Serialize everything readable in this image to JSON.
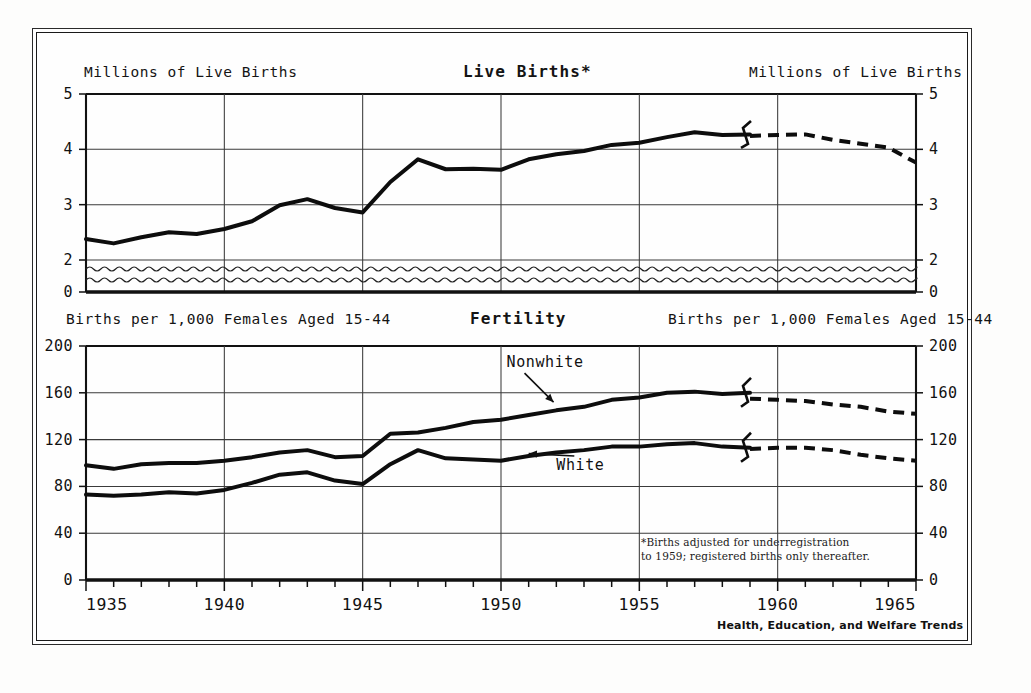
{
  "plate": {
    "source_credit": "Health, Education, and Welfare Trends"
  },
  "upper": {
    "title": "Live Births*",
    "left_axis_label": "Millions of Live Births",
    "right_axis_label": "Millions of Live Births"
  },
  "lower": {
    "title": "Fertility",
    "left_axis_label": "Births per 1,000 Females Aged 15-44",
    "right_axis_label": "Births per 1,000 Females Aged 15-44",
    "footnote": "*Births adjusted for underregistration\nto 1959; registered births only thereafter."
  },
  "chart_data": [
    {
      "type": "line",
      "title": "Live Births*",
      "xlabel": "",
      "ylabel": "Millions of Live Births",
      "xlim": [
        1935,
        1965
      ],
      "ylim": [
        0,
        5
      ],
      "yticks": [
        0,
        2,
        3,
        4,
        5
      ],
      "ytick_labels": [
        "0",
        "2",
        "3",
        "4",
        "5"
      ],
      "axis_break": {
        "between": [
          0,
          2
        ],
        "style": "wavy"
      },
      "xticks": [
        1935,
        1940,
        1945,
        1950,
        1955,
        1960,
        1965
      ],
      "xtick_labels": [
        "1935",
        "1940",
        "1945",
        "1950",
        "1955",
        "1960",
        "1965"
      ],
      "minor_xtick_interval": 1,
      "gridlines": "both",
      "legend": "none",
      "series": [
        {
          "name": "Live Births",
          "x": [
            1935,
            1936,
            1937,
            1938,
            1939,
            1940,
            1941,
            1942,
            1943,
            1944,
            1945,
            1946,
            1947,
            1948,
            1949,
            1950,
            1951,
            1952,
            1953,
            1954,
            1955,
            1956,
            1957,
            1958,
            1959
          ],
          "values": [
            2.38,
            2.3,
            2.41,
            2.5,
            2.47,
            2.56,
            2.7,
            2.99,
            3.1,
            2.94,
            2.86,
            3.41,
            3.82,
            3.64,
            3.65,
            3.63,
            3.82,
            3.91,
            3.97,
            4.08,
            4.12,
            4.22,
            4.31,
            4.26,
            4.27
          ],
          "style": "solid",
          "segment": "adjusted-to-1959"
        },
        {
          "name": "Live Births (registered only)",
          "x": [
            1959,
            1960,
            1961,
            1962,
            1963,
            1964,
            1965
          ],
          "values": [
            4.24,
            4.26,
            4.27,
            4.17,
            4.1,
            4.03,
            3.76
          ],
          "style": "dashed",
          "segment": "registered-after-1959"
        }
      ],
      "break_markers": [
        {
          "x": 1959,
          "note": "series discontinuity 1959"
        }
      ]
    },
    {
      "type": "line",
      "title": "Fertility",
      "xlabel": "",
      "ylabel": "Births per 1,000 Females Aged 15-44",
      "xlim": [
        1935,
        1965
      ],
      "ylim": [
        0,
        200
      ],
      "yticks": [
        0,
        40,
        80,
        120,
        160,
        200
      ],
      "ytick_labels": [
        "0",
        "40",
        "80",
        "120",
        "160",
        "200"
      ],
      "xticks": [
        1935,
        1940,
        1945,
        1950,
        1955,
        1960,
        1965
      ],
      "xtick_labels": [
        "1935",
        "1940",
        "1945",
        "1950",
        "1955",
        "1960",
        "1965"
      ],
      "minor_xtick_interval": 1,
      "gridlines": "both",
      "legend": "inline-annotations",
      "annotations": [
        {
          "text": "Nonwhite",
          "series": "Nonwhite",
          "x": 1950.2,
          "y": 182,
          "points_to_x": 1951.9,
          "points_to_y": 152
        },
        {
          "text": "White",
          "series": "White",
          "x": 1952.0,
          "y": 94,
          "points_to_x": 1951.0,
          "points_to_y": 108
        }
      ],
      "series": [
        {
          "name": "Nonwhite",
          "x": [
            1935,
            1936,
            1937,
            1938,
            1939,
            1940,
            1941,
            1942,
            1943,
            1944,
            1945,
            1946,
            1947,
            1948,
            1949,
            1950,
            1951,
            1952,
            1953,
            1954,
            1955,
            1956,
            1957,
            1958,
            1959
          ],
          "values": [
            98,
            95,
            99,
            100,
            100,
            102,
            105,
            109,
            111,
            105,
            106,
            125,
            126,
            130,
            135,
            137,
            141,
            145,
            148,
            154,
            156,
            160,
            161,
            159,
            160
          ],
          "style": "solid"
        },
        {
          "name": "Nonwhite",
          "x": [
            1959,
            1960,
            1961,
            1962,
            1963,
            1964,
            1965
          ],
          "values": [
            155,
            154,
            153,
            150,
            148,
            144,
            142
          ],
          "style": "dashed"
        },
        {
          "name": "White",
          "x": [
            1935,
            1936,
            1937,
            1938,
            1939,
            1940,
            1941,
            1942,
            1943,
            1944,
            1945,
            1946,
            1947,
            1948,
            1949,
            1950,
            1951,
            1952,
            1953,
            1954,
            1955,
            1956,
            1957,
            1958,
            1959
          ],
          "values": [
            73,
            72,
            73,
            75,
            74,
            77,
            83,
            90,
            92,
            85,
            82,
            99,
            111,
            104,
            103,
            102,
            106,
            109,
            111,
            114,
            114,
            116,
            117,
            114,
            113
          ],
          "style": "solid"
        },
        {
          "name": "White",
          "x": [
            1959,
            1960,
            1961,
            1962,
            1963,
            1964,
            1965
          ],
          "values": [
            112,
            113,
            113,
            111,
            107,
            104,
            102
          ],
          "style": "dashed"
        }
      ],
      "break_markers": [
        {
          "x": 1959,
          "series": "Nonwhite",
          "note": "series discontinuity 1959"
        },
        {
          "x": 1959,
          "series": "White",
          "note": "series discontinuity 1959"
        }
      ]
    }
  ]
}
